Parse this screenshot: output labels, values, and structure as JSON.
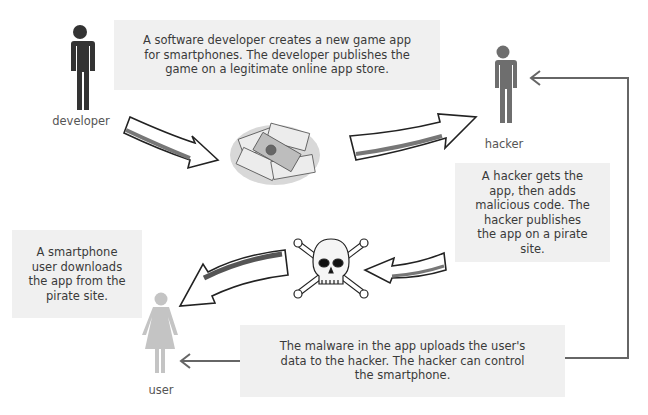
{
  "boxes": {
    "developer_step": "A software developer creates a new game app for smartphones. The developer publishes the game on a legitimate online app store.",
    "hacker_step": "A hacker gets the app, then adds malicious code. The hacker publishes the app on a pirate site.",
    "user_step": "A smartphone user downloads the app from the pirate site.",
    "malware_step": "The malware in the app uploads the user's data to the hacker. The hacker can control the smartphone."
  },
  "actors": {
    "developer": {
      "label": "developer",
      "color": "#333333"
    },
    "hacker": {
      "label": "hacker",
      "color": "#6e6e6e"
    },
    "user": {
      "label": "user",
      "color": "#c4c4c4"
    }
  },
  "icons": [
    "money-pile-icon",
    "skull-crossbones-icon"
  ],
  "colors": {
    "box_bg": "#f0f0f0",
    "connector": "#666666"
  }
}
